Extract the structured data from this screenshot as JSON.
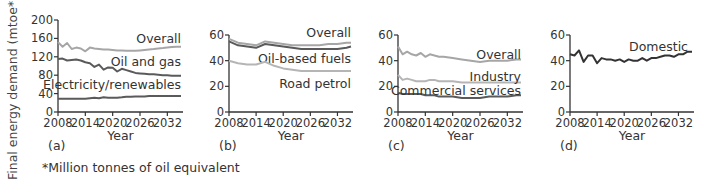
{
  "figure": {
    "ylabel": "Final energy demand (mtoe*)",
    "footnote": "*Million tonnes of oil equivalent",
    "xlabel": "Year"
  },
  "chart_data": [
    {
      "type": "line",
      "panel": "(a)",
      "title": "",
      "xlabel": "Year",
      "ylabel": "Final energy demand (mtoe*)",
      "xticks": [
        "2008",
        "2014",
        "2020",
        "2026",
        "2032"
      ],
      "yticks": [
        "0",
        "40",
        "80",
        "120",
        "160",
        "200"
      ],
      "xlim": [
        2008,
        2035
      ],
      "ylim": [
        0,
        200
      ],
      "grid": false,
      "x": [
        2008,
        2009,
        2010,
        2011,
        2012,
        2013,
        2014,
        2015,
        2016,
        2017,
        2018,
        2019,
        2020,
        2021,
        2022,
        2023,
        2024,
        2025,
        2026,
        2027,
        2028,
        2029,
        2030,
        2031,
        2032,
        2033,
        2034,
        2035
      ],
      "series": [
        {
          "name": "Overall",
          "color": "#a6a6a6",
          "values": [
            152,
            142,
            150,
            137,
            140,
            138,
            132,
            140,
            138,
            137,
            136,
            136,
            135,
            134,
            134,
            133,
            133,
            133,
            134,
            135,
            136,
            137,
            138,
            139,
            140,
            141,
            142,
            142
          ]
        },
        {
          "name": "Oil and gas",
          "color": "#5a5a5a",
          "values": [
            115,
            116,
            112,
            113,
            114,
            112,
            108,
            106,
            98,
            103,
            92,
            97,
            96,
            88,
            94,
            91,
            88,
            85,
            84,
            83,
            82,
            82,
            81,
            80,
            80,
            79,
            79,
            79
          ]
        },
        {
          "name": "Electricity/renewables",
          "color": "#5a5a5a",
          "values": [
            29,
            29,
            29,
            29,
            29,
            29,
            29,
            30,
            31,
            30,
            32,
            31,
            31,
            31,
            32,
            33,
            33,
            34,
            34,
            34,
            35,
            35,
            35,
            35,
            35,
            35,
            35,
            35
          ]
        }
      ],
      "annotations": [
        "Overall",
        "Oil and gas",
        "Electricity/renewables"
      ]
    },
    {
      "type": "line",
      "panel": "(b)",
      "xlabel": "Year",
      "xticks": [
        "2008",
        "2014",
        "2020",
        "2026",
        "2032"
      ],
      "yticks": [
        "0",
        "20",
        "40",
        "60"
      ],
      "xlim": [
        2008,
        2035
      ],
      "ylim": [
        0,
        60
      ],
      "grid": false,
      "x": [
        2008,
        2010,
        2012,
        2014,
        2016,
        2018,
        2020,
        2022,
        2024,
        2026,
        2028,
        2030,
        2032,
        2034,
        2035
      ],
      "series": [
        {
          "name": "Overall",
          "color": "#a6a6a6",
          "values": [
            57,
            54,
            53,
            52,
            55,
            54,
            53,
            52,
            52,
            52,
            52,
            53,
            53,
            54,
            54
          ]
        },
        {
          "name": "Oil-based fuels",
          "color": "#5a5a5a",
          "values": [
            55,
            52,
            51,
            50,
            53,
            52,
            51,
            50,
            49,
            49,
            49,
            49,
            49,
            50,
            51
          ]
        },
        {
          "name": "Road petrol",
          "color": "#b5b5b5",
          "values": [
            40,
            38,
            37,
            37,
            39,
            36,
            34,
            33,
            32,
            32,
            32,
            32,
            32,
            32,
            32
          ]
        }
      ],
      "annotations": [
        "Overall",
        "Oil-based fuels",
        "Road petrol"
      ]
    },
    {
      "type": "line",
      "panel": "(c)",
      "xlabel": "Year",
      "xticks": [
        "2008",
        "2014",
        "2020",
        "2026",
        "2032"
      ],
      "yticks": [
        "0",
        "20",
        "40",
        "60"
      ],
      "xlim": [
        2008,
        2035
      ],
      "ylim": [
        0,
        60
      ],
      "grid": false,
      "x": [
        2008,
        2009,
        2010,
        2011,
        2012,
        2013,
        2014,
        2015,
        2016,
        2017,
        2018,
        2020,
        2022,
        2024,
        2026,
        2028,
        2030,
        2032,
        2034,
        2035
      ],
      "series": [
        {
          "name": "Overall",
          "color": "#a6a6a6",
          "values": [
            51,
            45,
            47,
            45,
            44,
            46,
            43,
            45,
            44,
            43,
            43,
            42,
            41,
            40,
            39,
            40,
            40,
            40,
            41,
            41
          ]
        },
        {
          "name": "Industry",
          "color": "#b5b5b5",
          "values": [
            29,
            25,
            26,
            25,
            24,
            24,
            24,
            25,
            25,
            24,
            24,
            24,
            23,
            23,
            23,
            23,
            23,
            23,
            23,
            23
          ]
        },
        {
          "name": "Commercial services",
          "color": "#5a5a5a",
          "values": [
            15,
            14,
            14,
            14,
            14,
            14,
            13,
            13,
            13,
            12,
            12,
            12,
            11,
            11,
            11,
            12,
            12,
            12,
            13,
            13
          ]
        }
      ],
      "annotations": [
        "Overall",
        "Industry",
        "Commercial services"
      ]
    },
    {
      "type": "line",
      "panel": "(d)",
      "xlabel": "Year",
      "xticks": [
        "2008",
        "2014",
        "2020",
        "2026",
        "2032"
      ],
      "yticks": [
        "0",
        "20",
        "40",
        "60"
      ],
      "xlim": [
        2008,
        2035
      ],
      "ylim": [
        0,
        60
      ],
      "grid": false,
      "x": [
        2008,
        2009,
        2010,
        2011,
        2012,
        2013,
        2014,
        2015,
        2016,
        2017,
        2018,
        2019,
        2020,
        2021,
        2022,
        2023,
        2024,
        2025,
        2026,
        2027,
        2028,
        2029,
        2030,
        2031,
        2032,
        2033,
        2034,
        2035
      ],
      "series": [
        {
          "name": "Domestic",
          "color": "#333333",
          "values": [
            45,
            44,
            48,
            39,
            44,
            44,
            38,
            42,
            41,
            41,
            40,
            41,
            39,
            41,
            40,
            40,
            42,
            40,
            42,
            42,
            43,
            44,
            44,
            43,
            45,
            45,
            47,
            47
          ]
        }
      ],
      "annotations": [
        "Domestic"
      ]
    }
  ]
}
